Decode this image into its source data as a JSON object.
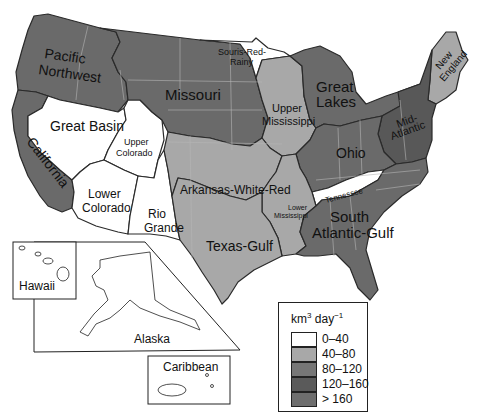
{
  "map": {
    "subject": "Water regions of the United States",
    "regions": [
      {
        "name": "Pacific Northwest",
        "label_lines": [
          "Pacific",
          "Northwest"
        ],
        "class": "80-120",
        "color": "#6a6a6a"
      },
      {
        "name": "Missouri",
        "label_lines": [
          "Missouri"
        ],
        "class": "80-120",
        "color": "#6a6a6a"
      },
      {
        "name": "Souris-Red-Rainy",
        "label_lines": [
          "Souris-Red-",
          "Rainy"
        ],
        "class": "0-40",
        "color": "#ffffff"
      },
      {
        "name": "Upper Mississippi",
        "label_lines": [
          "Upper",
          "Mississippi"
        ],
        "class": "40-80",
        "color": "#a8a8a8"
      },
      {
        "name": "Great Lakes",
        "label_lines": [
          "Great",
          "Lakes"
        ],
        "class": "80-120",
        "color": "#6a6a6a"
      },
      {
        "name": "New England",
        "label_lines": [
          "New",
          "England"
        ],
        "class": "40-80",
        "color": "#a8a8a8"
      },
      {
        "name": "Mid-Atlantic",
        "label_lines": [
          "Mid-",
          "Atlantic"
        ],
        "class": "120-160",
        "color": "#585858"
      },
      {
        "name": "Ohio",
        "label_lines": [
          "Ohio"
        ],
        "class": "80-120",
        "color": "#6a6a6a"
      },
      {
        "name": "Great Basin",
        "label_lines": [
          "Great Basin"
        ],
        "class": "0-40",
        "color": "#ffffff"
      },
      {
        "name": "Upper Colorado",
        "label_lines": [
          "Upper",
          "Colorado"
        ],
        "class": "0-40",
        "color": "#ffffff"
      },
      {
        "name": "California",
        "label_lines": [
          "California"
        ],
        "class": "80-120",
        "color": "#6a6a6a"
      },
      {
        "name": "Lower Colorado",
        "label_lines": [
          "Lower",
          "Colorado"
        ],
        "class": "0-40",
        "color": "#ffffff"
      },
      {
        "name": "Rio Grande",
        "label_lines": [
          "Rio",
          "Grande"
        ],
        "class": "0-40",
        "color": "#ffffff"
      },
      {
        "name": "Arkansas-White-Red",
        "label_lines": [
          "Arkansas-White-Red"
        ],
        "class": "40-80",
        "color": "#a8a8a8"
      },
      {
        "name": "Lower Mississippi",
        "label_lines": [
          "Lower",
          "Mississippi"
        ],
        "class": "40-80",
        "color": "#a8a8a8"
      },
      {
        "name": "Tennessee",
        "label_lines": [
          "Tennessee"
        ],
        "class": "0-40",
        "color": "#ffffff"
      },
      {
        "name": "Texas-Gulf",
        "label_lines": [
          "Texas-Gulf"
        ],
        "class": "40-80",
        "color": "#a8a8a8"
      },
      {
        "name": "South Atlantic-Gulf",
        "label_lines": [
          "South",
          "Atlantic-Gulf"
        ],
        "class": "80-120",
        "color": "#6a6a6a"
      }
    ],
    "insets": [
      {
        "name": "Hawaii",
        "label": "Hawaii"
      },
      {
        "name": "Alaska",
        "label": "Alaska"
      },
      {
        "name": "Caribbean",
        "label": "Caribbean"
      }
    ]
  },
  "legend": {
    "title_unit": "km",
    "title_exp": "3",
    "title_rest": " day",
    "title_exp2": "−1",
    "items": [
      {
        "label": "0–40",
        "color": "#ffffff"
      },
      {
        "label": "40–80",
        "color": "#a8a8a8"
      },
      {
        "label": "80–120",
        "color": "#767676"
      },
      {
        "label": "120–160",
        "color": "#5a5a5a"
      },
      {
        "label": "> 160",
        "color": "#6e6e6e"
      }
    ]
  }
}
